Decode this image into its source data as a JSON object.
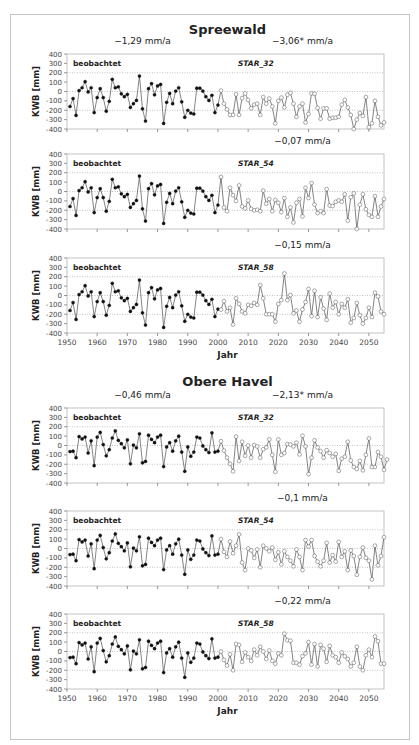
{
  "chart_data": [
    {
      "type": "line",
      "region": "Spreewald",
      "panels": [
        {
          "scenario": "STAR_32",
          "observed_label": "beobachtet",
          "observed_trend": "−1,29 mm/a",
          "projection_trend": "−3,06* mm/a",
          "ylabel": "KWB [mm]",
          "xlabel": "",
          "ylim": [
            -400,
            400
          ],
          "yticks": [
            400,
            300,
            200,
            100,
            0,
            -100,
            -200,
            -300,
            -400
          ],
          "xlim": [
            1950,
            2055
          ],
          "xticks": [
            1950,
            1960,
            1970,
            1980,
            1990,
            2000,
            2010,
            2020,
            2030,
            2040,
            2050
          ],
          "show_xtick_labels": false,
          "gridlines": [
            200,
            0,
            -200
          ],
          "observed": {
            "x_start": 1951,
            "values": [
              -160,
              -75,
              -255,
              10,
              40,
              105,
              -5,
              40,
              -225,
              -65,
              30,
              -65,
              -210,
              -105,
              130,
              40,
              50,
              -25,
              -55,
              -30,
              -170,
              -130,
              -95,
              165,
              -185,
              -315,
              30,
              85,
              -35,
              60,
              75,
              -340,
              -115,
              -20,
              -130,
              5,
              40,
              -110,
              -275,
              -200,
              -230,
              -240,
              35,
              35,
              5,
              -55,
              -95,
              -40,
              -225,
              -145
            ]
          },
          "projected": {
            "x_start": 2001,
            "values": [
              10,
              -130,
              -190,
              -250,
              -250,
              -30,
              -250,
              -70,
              -20,
              -90,
              -180,
              -140,
              -130,
              -250,
              -60,
              -130,
              -75,
              -160,
              -340,
              -100,
              -65,
              -170,
              -35,
              -15,
              -130,
              -270,
              -160,
              -130,
              -330,
              -240,
              -20,
              -25,
              -175,
              -290,
              -180,
              -180,
              -290,
              -280,
              -280,
              -270,
              -140,
              -90,
              -170,
              -250,
              -400,
              -300,
              -230,
              -260,
              -60,
              -380,
              -340,
              -100,
              -270,
              -360,
              -330
            ]
          }
        },
        {
          "scenario": "STAR_54",
          "observed_label": "beobachtet",
          "observed_trend": "",
          "projection_trend": "−0,07 mm/a",
          "ylabel": "KWB [mm]",
          "xlabel": "",
          "ylim": [
            -400,
            400
          ],
          "yticks": [
            400,
            300,
            200,
            100,
            0,
            -100,
            -200,
            -300,
            -400
          ],
          "xlim": [
            1950,
            2055
          ],
          "xticks": [
            1950,
            1960,
            1970,
            1980,
            1990,
            2000,
            2010,
            2020,
            2030,
            2040,
            2050
          ],
          "show_xtick_labels": false,
          "gridlines": [
            200,
            0,
            -200
          ],
          "observed": {
            "x_start": 1951,
            "values": [
              -160,
              -75,
              -255,
              10,
              40,
              105,
              -5,
              40,
              -225,
              -65,
              30,
              -65,
              -210,
              -105,
              130,
              40,
              50,
              -25,
              -55,
              -30,
              -170,
              -130,
              -95,
              165,
              -185,
              -315,
              30,
              85,
              -35,
              60,
              75,
              -340,
              -115,
              -20,
              -130,
              5,
              40,
              -110,
              -275,
              -200,
              -230,
              -240,
              35,
              35,
              5,
              -55,
              -95,
              -40,
              -225,
              -145
            ]
          },
          "projected": {
            "x_start": 2001,
            "values": [
              155,
              -170,
              -210,
              40,
              -40,
              -100,
              65,
              -160,
              -180,
              -95,
              -185,
              -200,
              -195,
              -210,
              10,
              -130,
              -80,
              -210,
              -90,
              -120,
              -220,
              -70,
              -270,
              -170,
              -330,
              -120,
              -80,
              -265,
              40,
              -70,
              90,
              -140,
              -230,
              -210,
              -230,
              25,
              -150,
              -155,
              -110,
              -95,
              -110,
              -30,
              -310,
              -60,
              -20,
              -400,
              -140,
              -30,
              -190,
              -250,
              -270,
              -50,
              -270,
              -160,
              -80
            ]
          }
        },
        {
          "scenario": "STAR_58",
          "observed_label": "beobachtet",
          "observed_trend": "",
          "projection_trend": "−0,15 mm/a",
          "ylabel": "KWB [mm]",
          "xlabel": "Jahr",
          "ylim": [
            -400,
            400
          ],
          "yticks": [
            400,
            300,
            200,
            100,
            0,
            -100,
            -200,
            -300,
            -400
          ],
          "xlim": [
            1950,
            2055
          ],
          "xticks": [
            1950,
            1960,
            1970,
            1980,
            1990,
            2000,
            2010,
            2020,
            2030,
            2040,
            2050
          ],
          "show_xtick_labels": true,
          "gridlines": [
            200,
            0,
            -200
          ],
          "observed": {
            "x_start": 1951,
            "values": [
              -160,
              -75,
              -255,
              10,
              40,
              105,
              -5,
              40,
              -225,
              -65,
              30,
              -65,
              -210,
              -105,
              130,
              40,
              50,
              -25,
              -55,
              -30,
              -170,
              -130,
              -95,
              165,
              -185,
              -315,
              30,
              85,
              -35,
              60,
              75,
              -340,
              -115,
              -20,
              -130,
              5,
              40,
              -110,
              -275,
              -200,
              -230,
              -240,
              35,
              35,
              5,
              -55,
              -95,
              -40,
              -225,
              -145
            ]
          },
          "projected": {
            "x_start": 2001,
            "values": [
              -150,
              -60,
              -170,
              -130,
              -310,
              -30,
              -90,
              -170,
              -190,
              -100,
              -110,
              -80,
              -100,
              110,
              -30,
              -200,
              -200,
              -200,
              -280,
              -90,
              -50,
              235,
              -50,
              5,
              -190,
              -160,
              -280,
              -150,
              -70,
              70,
              -220,
              50,
              -230,
              -20,
              -140,
              -260,
              20,
              -130,
              -70,
              -200,
              -90,
              -130,
              -40,
              -290,
              -240,
              -80,
              -210,
              -300,
              -240,
              -130,
              -230,
              30,
              -10,
              -170,
              -200
            ]
          }
        }
      ]
    },
    {
      "type": "line",
      "region": "Obere Havel",
      "panels": [
        {
          "scenario": "STAR_32",
          "observed_label": "beobachtet",
          "observed_trend": "−0,46 mm/a",
          "projection_trend": "−2,13* mm/a",
          "ylabel": "KWB [mm]",
          "xlabel": "",
          "ylim": [
            -400,
            400
          ],
          "yticks": [
            400,
            300,
            200,
            100,
            0,
            -100,
            -200,
            -300,
            -400
          ],
          "xlim": [
            1950,
            2055
          ],
          "xticks": [
            1950,
            1960,
            1970,
            1980,
            1990,
            2000,
            2010,
            2020,
            2030,
            2040,
            2050
          ],
          "show_xtick_labels": false,
          "gridlines": [
            200,
            0,
            -200
          ],
          "observed": {
            "x_start": 1951,
            "values": [
              -65,
              -60,
              -130,
              95,
              70,
              90,
              -80,
              50,
              -215,
              90,
              140,
              10,
              -110,
              -45,
              80,
              155,
              55,
              20,
              -25,
              60,
              -195,
              5,
              -25,
              125,
              -185,
              -170,
              110,
              65,
              30,
              90,
              110,
              -225,
              -15,
              30,
              -60,
              50,
              100,
              -70,
              -275,
              -15,
              -115,
              -70,
              90,
              80,
              -5,
              -45,
              -75,
              135,
              -70,
              -60
            ]
          },
          "projected": {
            "x_start": 2001,
            "values": [
              45,
              -55,
              -130,
              -195,
              -275,
              95,
              -165,
              40,
              -110,
              0,
              -130,
              5,
              -10,
              -130,
              -40,
              -20,
              65,
              -100,
              -280,
              65,
              -100,
              -80,
              15,
              10,
              -10,
              30,
              -95,
              105,
              -10,
              -305,
              -130,
              55,
              -20,
              -60,
              -130,
              -50,
              -80,
              -120,
              -90,
              -270,
              -140,
              -120,
              40,
              -160,
              -230,
              -250,
              -165,
              -265,
              -100,
              75,
              -230,
              -230,
              -70,
              -120,
              -260,
              -150
            ]
          }
        },
        {
          "scenario": "STAR_54",
          "observed_label": "beobachtet",
          "observed_trend": "",
          "projection_trend": "−0,1 mm/a",
          "ylabel": "KWB [mm]",
          "xlabel": "",
          "ylim": [
            -400,
            400
          ],
          "yticks": [
            400,
            300,
            200,
            100,
            0,
            -100,
            -200,
            -300,
            -400
          ],
          "xlim": [
            1950,
            2055
          ],
          "xticks": [
            1950,
            1960,
            1970,
            1980,
            1990,
            2000,
            2010,
            2020,
            2030,
            2040,
            2050
          ],
          "show_xtick_labels": false,
          "gridlines": [
            200,
            0,
            -200
          ],
          "observed": {
            "x_start": 1951,
            "values": [
              -65,
              -60,
              -130,
              95,
              70,
              90,
              -80,
              50,
              -215,
              90,
              140,
              10,
              -110,
              -45,
              80,
              155,
              55,
              20,
              -25,
              60,
              -195,
              5,
              -25,
              125,
              -185,
              -170,
              110,
              65,
              30,
              90,
              110,
              -225,
              -15,
              30,
              -60,
              50,
              100,
              -70,
              -275,
              -15,
              -115,
              -70,
              90,
              80,
              -5,
              -45,
              -75,
              135,
              -70,
              -60
            ]
          },
          "projected": {
            "x_start": 2001,
            "values": [
              100,
              -35,
              -90,
              75,
              -50,
              30,
              150,
              -150,
              -230,
              0,
              -20,
              -100,
              -10,
              -200,
              30,
              0,
              -30,
              10,
              -120,
              -40,
              -170,
              -30,
              -90,
              -130,
              -190,
              -10,
              -90,
              -230,
              90,
              20,
              90,
              -80,
              -140,
              -190,
              -130,
              60,
              -150,
              -70,
              -140,
              70,
              -90,
              -30,
              -230,
              -20,
              -80,
              -280,
              -90,
              10,
              -100,
              -130,
              -330,
              30,
              -180,
              -80,
              120
            ]
          }
        },
        {
          "scenario": "STAR_58",
          "observed_label": "beobachtet",
          "observed_trend": "",
          "projection_trend": "−0,22 mm/a",
          "ylabel": "KWB [mm]",
          "xlabel": "Jahr",
          "ylim": [
            -400,
            400
          ],
          "yticks": [
            400,
            300,
            200,
            100,
            0,
            -100,
            -200,
            -300,
            -400
          ],
          "xlim": [
            1950,
            2055
          ],
          "xticks": [
            1950,
            1960,
            1970,
            1980,
            1990,
            2000,
            2010,
            2020,
            2030,
            2040,
            2050
          ],
          "show_xtick_labels": true,
          "gridlines": [
            200,
            0,
            -200
          ],
          "observed": {
            "x_start": 1951,
            "values": [
              -65,
              -60,
              -130,
              95,
              70,
              90,
              -80,
              50,
              -215,
              90,
              140,
              10,
              -110,
              -45,
              80,
              155,
              55,
              20,
              -25,
              60,
              -195,
              5,
              -25,
              125,
              -185,
              -170,
              110,
              65,
              30,
              90,
              110,
              -225,
              -15,
              30,
              -60,
              50,
              100,
              -70,
              -275,
              -15,
              -115,
              -70,
              90,
              80,
              -5,
              -45,
              -75,
              135,
              -70,
              -60
            ]
          },
          "projected": {
            "x_start": 2001,
            "values": [
              0,
              -90,
              -150,
              -30,
              -200,
              80,
              70,
              -110,
              -10,
              -60,
              -100,
              20,
              -40,
              50,
              0,
              -80,
              10,
              -100,
              -130,
              -20,
              -40,
              190,
              120,
              115,
              -120,
              -120,
              -140,
              -50,
              -20,
              100,
              -140,
              80,
              -160,
              70,
              30,
              -110,
              60,
              -40,
              -60,
              -120,
              -10,
              -50,
              -80,
              -160,
              -120,
              50,
              -160,
              -200,
              -40,
              20,
              -60,
              160,
              110,
              -130,
              -130
            ]
          }
        }
      ]
    }
  ]
}
